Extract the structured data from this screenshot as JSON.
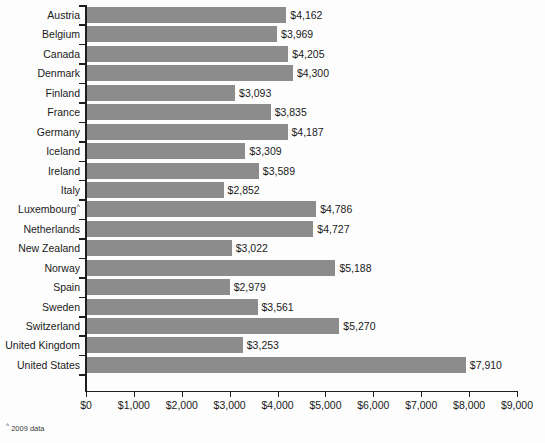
{
  "chart_data": {
    "type": "bar",
    "orientation": "horizontal",
    "title": "",
    "subtitle": "",
    "xlabel": "",
    "ylabel": "",
    "xlim": [
      0,
      9000
    ],
    "xtick_step": 1000,
    "grid": false,
    "legend": null,
    "bar_color": "#8c8c8c",
    "axis_color": "#1e1e1e",
    "background": "#fdfdfd",
    "value_prefix": "$",
    "categories": [
      "Austria",
      "Belgium",
      "Canada",
      "Denmark",
      "Finland",
      "France",
      "Germany",
      "Iceland",
      "Ireland",
      "Italy",
      "Luxembourg",
      "Netherlands",
      "New Zealand",
      "Norway",
      "Spain",
      "Sweden",
      "Switzerland",
      "United Kingdom",
      "United States"
    ],
    "values": [
      4162,
      3969,
      4205,
      4300,
      3093,
      3835,
      4187,
      3309,
      3589,
      2852,
      4786,
      4727,
      3022,
      5188,
      2979,
      3561,
      5270,
      3253,
      7910
    ],
    "value_labels": [
      "$4,162",
      "$3,969",
      "$4,205",
      "$4,300",
      "$3,093",
      "$3,835",
      "$4,187",
      "$3,309",
      "$3,589",
      "$2,852",
      "$4,786",
      "$4,727",
      "$3,022",
      "$5,188",
      "$2,979",
      "$3,561",
      "$5,270",
      "$3,253",
      "$7,910"
    ],
    "category_footnote_marks": {
      "Luxembourg": "^"
    },
    "xtick_labels": [
      "$0",
      "$1,000",
      "$2,000",
      "$3,000",
      "$4,000",
      "$5,000",
      "$6,000",
      "$7,000",
      "$8,000",
      "$9,000"
    ],
    "xtick_values": [
      0,
      1000,
      2000,
      3000,
      4000,
      5000,
      6000,
      7000,
      8000,
      9000
    ],
    "annotations": [
      {
        "mark": "^",
        "text": "2009 data"
      }
    ]
  },
  "footnote": {
    "mark": "^",
    "text": "2009 data"
  }
}
